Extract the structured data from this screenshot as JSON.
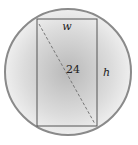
{
  "diagram": {
    "labels": {
      "width": "w",
      "height": "h",
      "diagonal": "24"
    },
    "colors": {
      "circle_edge": "#8a8a8a",
      "circle_fill_center": "#bdbdbd",
      "circle_fill_edge": "#ececec",
      "rectangle_stroke": "#555555",
      "diagonal_stroke": "#777777"
    }
  }
}
